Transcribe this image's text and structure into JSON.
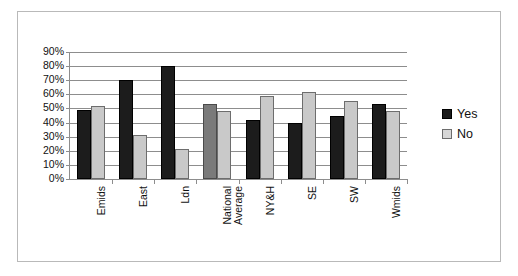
{
  "chart_data": {
    "type": "bar",
    "title": "",
    "xlabel": "",
    "ylabel": "",
    "ylim": [
      0,
      90
    ],
    "ytick_step": 10,
    "ytick_labels": [
      "0%",
      "10%",
      "20%",
      "30%",
      "40%",
      "50%",
      "60%",
      "70%",
      "80%",
      "90%"
    ],
    "grid": true,
    "legend_position": "right",
    "categories": [
      "Emids",
      "East",
      "Ldn",
      "National\nAverage",
      "NY&H",
      "SE",
      "SW",
      "Wmids"
    ],
    "series": [
      {
        "name": "Yes",
        "color": "#1c1c1c",
        "values": [
          49,
          70,
          80,
          53,
          42,
          40,
          45,
          53
        ]
      },
      {
        "name": "No",
        "color": "#c9c9c9",
        "values": [
          52,
          31,
          21,
          48,
          59,
          62,
          55,
          48
        ]
      }
    ]
  },
  "legend": {
    "items": [
      {
        "label": "Yes",
        "swatch": "yes"
      },
      {
        "label": "No",
        "swatch": "no"
      }
    ]
  }
}
